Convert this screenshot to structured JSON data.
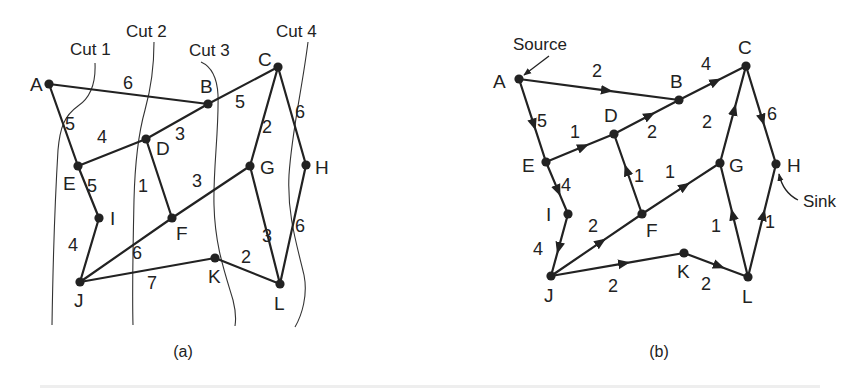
{
  "figure": {
    "panels": [
      {
        "id": "a",
        "caption": "(a)",
        "nodes": [
          {
            "id": "A",
            "x": 49,
            "y": 84,
            "lx": 30,
            "ly": 91
          },
          {
            "id": "B",
            "x": 208,
            "y": 104,
            "lx": 200,
            "ly": 93
          },
          {
            "id": "C",
            "x": 278,
            "y": 67,
            "lx": 258,
            "ly": 66
          },
          {
            "id": "D",
            "x": 146,
            "y": 139,
            "lx": 156,
            "ly": 155
          },
          {
            "id": "E",
            "x": 78,
            "y": 166,
            "lx": 63,
            "ly": 190
          },
          {
            "id": "G",
            "x": 250,
            "y": 166,
            "lx": 260,
            "ly": 174
          },
          {
            "id": "H",
            "x": 306,
            "y": 165,
            "lx": 315,
            "ly": 174
          },
          {
            "id": "I",
            "x": 99,
            "y": 218,
            "lx": 110,
            "ly": 225
          },
          {
            "id": "F",
            "x": 172,
            "y": 218,
            "lx": 176,
            "ly": 240
          },
          {
            "id": "J",
            "x": 80,
            "y": 282,
            "lx": 74,
            "ly": 307
          },
          {
            "id": "K",
            "x": 215,
            "y": 258,
            "lx": 208,
            "ly": 283
          },
          {
            "id": "L",
            "x": 280,
            "y": 284,
            "lx": 274,
            "ly": 310
          }
        ],
        "edges": [
          {
            "from": "A",
            "to": "B",
            "weight": "6",
            "lx": 128,
            "ly": 89
          },
          {
            "from": "A",
            "to": "E",
            "weight": "5",
            "lx": 70,
            "ly": 130
          },
          {
            "from": "B",
            "to": "C",
            "weight": "5",
            "lx": 240,
            "ly": 108
          },
          {
            "from": "D",
            "to": "B",
            "weight": "3",
            "lx": 180,
            "ly": 140
          },
          {
            "from": "E",
            "to": "D",
            "weight": "4",
            "lx": 102,
            "ly": 143
          },
          {
            "from": "E",
            "to": "I",
            "weight": "5",
            "lx": 92,
            "ly": 192
          },
          {
            "from": "D",
            "to": "F",
            "weight": "1",
            "lx": 143,
            "ly": 192
          },
          {
            "from": "C",
            "to": "G",
            "weight": "2",
            "lx": 267,
            "ly": 133
          },
          {
            "from": "C",
            "to": "H",
            "weight": "6",
            "lx": 300,
            "ly": 118
          },
          {
            "from": "G",
            "to": "F",
            "weight": "3",
            "lx": 197,
            "ly": 187
          },
          {
            "from": "I",
            "to": "J",
            "weight": "4",
            "lx": 73,
            "ly": 251
          },
          {
            "from": "J",
            "to": "F",
            "weight": "6",
            "lx": 137,
            "ly": 259
          },
          {
            "from": "J",
            "to": "K",
            "weight": "7",
            "lx": 152,
            "ly": 289
          },
          {
            "from": "K",
            "to": "L",
            "weight": "2",
            "lx": 246,
            "ly": 263
          },
          {
            "from": "G",
            "to": "L",
            "weight": "3",
            "lx": 267,
            "ly": 242
          },
          {
            "from": "H",
            "to": "L",
            "weight": "6",
            "lx": 300,
            "ly": 232
          }
        ],
        "cuts": [
          {
            "label": "Cut 1",
            "lx": 70,
            "ly": 55,
            "path": "M95,63 C96,85 90,98 78,106 C64,116 60,128 58,150 C55,200 53,260 52,325"
          },
          {
            "label": "Cut 2",
            "lx": 126,
            "ly": 37,
            "path": "M154,42 C154,70 150,92 145,110 C138,135 135,160 134,200 C133,250 132,290 133,325"
          },
          {
            "label": "Cut 3",
            "lx": 189,
            "ly": 56,
            "path": "M201,62 C210,66 217,75 218,95 C219,130 213,170 214,205 C215,245 224,270 233,300 C236,312 236,320 235,326"
          },
          {
            "label": "Cut 4",
            "lx": 276,
            "ly": 37,
            "path": "M308,42 C302,90 292,130 289,175 C287,215 297,245 304,275 C308,295 302,315 295,327"
          }
        ]
      },
      {
        "id": "b",
        "caption": "(b)",
        "annotations": [
          {
            "label": "Source",
            "lx": 513,
            "ly": 50,
            "arrow": "M549,56 L524,75"
          },
          {
            "label": "Sink",
            "lx": 803,
            "ly": 207,
            "arrow": "M798,200 C790,196 782,188 779,174"
          }
        ],
        "nodes": [
          {
            "id": "A",
            "x": 519,
            "y": 79,
            "lx": 493,
            "ly": 88
          },
          {
            "id": "B",
            "x": 679,
            "y": 100,
            "lx": 670,
            "ly": 88
          },
          {
            "id": "C",
            "x": 746,
            "y": 66,
            "lx": 738,
            "ly": 54
          },
          {
            "id": "D",
            "x": 614,
            "y": 134,
            "lx": 604,
            "ly": 122
          },
          {
            "id": "E",
            "x": 546,
            "y": 162,
            "lx": 522,
            "ly": 172
          },
          {
            "id": "G",
            "x": 720,
            "y": 163,
            "lx": 729,
            "ly": 172
          },
          {
            "id": "H",
            "x": 776,
            "y": 164,
            "lx": 787,
            "ly": 172
          },
          {
            "id": "I",
            "x": 568,
            "y": 214,
            "lx": 546,
            "ly": 221
          },
          {
            "id": "F",
            "x": 642,
            "y": 214,
            "lx": 646,
            "ly": 237
          },
          {
            "id": "J",
            "x": 551,
            "y": 276,
            "lx": 544,
            "ly": 302
          },
          {
            "id": "K",
            "x": 684,
            "y": 253,
            "lx": 677,
            "ly": 278
          },
          {
            "id": "L",
            "x": 748,
            "y": 277,
            "lx": 742,
            "ly": 303
          }
        ],
        "edges": [
          {
            "from": "A",
            "to": "B",
            "weight": "2",
            "lx": 597,
            "ly": 77
          },
          {
            "from": "A",
            "to": "E",
            "weight": "5",
            "lx": 542,
            "ly": 127
          },
          {
            "from": "B",
            "to": "C",
            "weight": "4",
            "lx": 706,
            "ly": 70
          },
          {
            "from": "E",
            "to": "D",
            "weight": "1",
            "lx": 575,
            "ly": 138
          },
          {
            "from": "D",
            "to": "B",
            "weight": "2",
            "lx": 652,
            "ly": 138
          },
          {
            "from": "E",
            "to": "I",
            "weight": "4",
            "lx": 566,
            "ly": 191
          },
          {
            "from": "F",
            "to": "D",
            "weight": "1",
            "lx": 639,
            "ly": 182
          },
          {
            "from": "F",
            "to": "G",
            "weight": "1",
            "lx": 670,
            "ly": 178
          },
          {
            "from": "G",
            "to": "C",
            "weight": "2",
            "lx": 707,
            "ly": 128
          },
          {
            "from": "C",
            "to": "H",
            "weight": "6",
            "lx": 772,
            "ly": 120
          },
          {
            "from": "I",
            "to": "J",
            "weight": "4",
            "lx": 538,
            "ly": 255
          },
          {
            "from": "J",
            "to": "F",
            "weight": "2",
            "lx": 593,
            "ly": 232
          },
          {
            "from": "J",
            "to": "K",
            "weight": "2",
            "lx": 613,
            "ly": 292
          },
          {
            "from": "K",
            "to": "L",
            "weight": "2",
            "lx": 706,
            "ly": 290
          },
          {
            "from": "L",
            "to": "G",
            "weight": "1",
            "lx": 716,
            "ly": 232
          },
          {
            "from": "L",
            "to": "H",
            "weight": "1",
            "lx": 770,
            "ly": 228
          }
        ]
      }
    ]
  }
}
